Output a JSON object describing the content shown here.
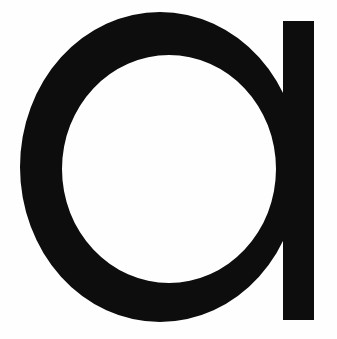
{
  "image": {
    "kind": "letterform-glyph",
    "character": "a",
    "character_name": "latin-small-letter-a",
    "style": "single-storey geometric sans-serif",
    "width": 337,
    "height": 339
  },
  "colors": {
    "background": "#fefefe",
    "glyph": "#0d0d0d"
  },
  "geometry": {
    "bowl": {
      "shape": "ellipse-ring",
      "outer_cx": 160,
      "outer_cy": 167,
      "outer_rx": 140,
      "outer_ry": 155,
      "inner_cx": 169,
      "inner_cy": 169,
      "inner_rx": 107,
      "inner_ry": 114
    },
    "stem": {
      "shape": "rectangle",
      "x": 283,
      "y": 21,
      "width": 31,
      "height": 299
    }
  }
}
